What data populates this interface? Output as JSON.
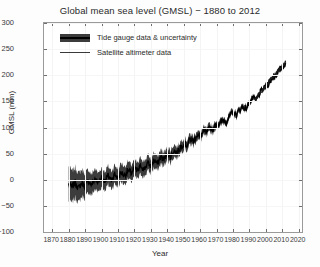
{
  "chart_data": {
    "type": "line",
    "title": "Global mean sea level (GMSL) − 1880 to 2012",
    "xlabel": "Year",
    "ylabel": "GMSL (mm)",
    "xlim": [
      1865,
      2022
    ],
    "ylim": [
      -100,
      300
    ],
    "grid": true,
    "legend_position": "upper-left-inside",
    "xticks": [
      "1870",
      "1880",
      "1890",
      "1900",
      "1910",
      "1920",
      "1930",
      "1940",
      "1950",
      "1960",
      "1970",
      "1980",
      "1990",
      "2000",
      "2010",
      "2020"
    ],
    "yticks": [
      "300",
      "250",
      "200",
      "150",
      "100",
      "50",
      "0",
      "−50",
      "−100"
    ],
    "legend": [
      {
        "label": "Tide gauge data & uncertainty",
        "marker": "band",
        "color": "#3c3c3c"
      },
      {
        "label": "Satellite altimeter data",
        "marker": "line",
        "color": "#3a3a3a"
      }
    ],
    "series": [
      {
        "name": "Tide gauge data & uncertainty",
        "x": [
          1880,
          1882,
          1884,
          1886,
          1888,
          1890,
          1892,
          1894,
          1896,
          1898,
          1900,
          1902,
          1904,
          1906,
          1908,
          1910,
          1912,
          1914,
          1916,
          1918,
          1920,
          1922,
          1924,
          1926,
          1928,
          1930,
          1932,
          1934,
          1936,
          1938,
          1940,
          1942,
          1944,
          1946,
          1948,
          1950,
          1952,
          1954,
          1956,
          1958,
          1960,
          1962,
          1964,
          1966,
          1968,
          1970,
          1972,
          1974,
          1976,
          1978,
          1980,
          1982,
          1984,
          1986,
          1988,
          1990,
          1992,
          1994,
          1996,
          1998,
          2000,
          2002,
          2004,
          2006,
          2008,
          2010,
          2012
        ],
        "values": [
          -8,
          -14,
          -5,
          -16,
          -6,
          -12,
          -2,
          -10,
          2,
          -6,
          5,
          -2,
          8,
          0,
          10,
          4,
          14,
          8,
          18,
          12,
          22,
          16,
          27,
          20,
          32,
          26,
          38,
          30,
          44,
          38,
          50,
          44,
          56,
          52,
          62,
          70,
          66,
          78,
          74,
          86,
          82,
          92,
          90,
          100,
          96,
          108,
          106,
          114,
          112,
          122,
          128,
          124,
          134,
          140,
          136,
          148,
          156,
          152,
          164,
          172,
          178,
          186,
          194,
          200,
          208,
          216,
          224
        ],
        "lower": [
          -42,
          -44,
          -34,
          -44,
          -32,
          -36,
          -24,
          -30,
          -18,
          -24,
          -14,
          -20,
          -10,
          -17,
          -8,
          -13,
          -4,
          -9,
          1,
          -4,
          6,
          1,
          11,
          5,
          17,
          12,
          23,
          17,
          30,
          25,
          37,
          32,
          44,
          41,
          51,
          59,
          56,
          68,
          65,
          77,
          74,
          84,
          82,
          92,
          89,
          101,
          99,
          108,
          106,
          116,
          122,
          119,
          129,
          135,
          132,
          144,
          152,
          148,
          161,
          169,
          175,
          183,
          191,
          197,
          205,
          213,
          221
        ],
        "upper": [
          26,
          16,
          24,
          12,
          20,
          12,
          20,
          10,
          22,
          12,
          24,
          16,
          26,
          17,
          28,
          21,
          32,
          25,
          35,
          28,
          38,
          31,
          43,
          35,
          47,
          40,
          53,
          43,
          58,
          51,
          63,
          56,
          68,
          63,
          73,
          81,
          76,
          88,
          83,
          95,
          90,
          100,
          98,
          108,
          103,
          115,
          113,
          120,
          118,
          128,
          134,
          129,
          139,
          145,
          140,
          152,
          160,
          156,
          167,
          175,
          181,
          189,
          197,
          203,
          211,
          219,
          227
        ]
      },
      {
        "name": "Satellite altimeter data",
        "x": [
          1993,
          1995,
          1997,
          1999,
          2001,
          2003,
          2005,
          2007,
          2009,
          2011,
          2012
        ],
        "values": [
          152,
          160,
          170,
          176,
          184,
          192,
          200,
          206,
          214,
          220,
          228
        ]
      }
    ]
  }
}
